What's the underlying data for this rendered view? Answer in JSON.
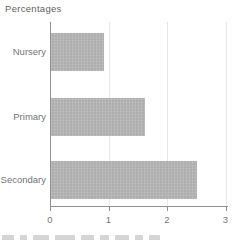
{
  "chart_data": {
    "type": "bar",
    "orientation": "horizontal",
    "title": "Percentages",
    "categories": [
      "Nursery",
      "Primary",
      "Secondary"
    ],
    "values": [
      0.9,
      1.6,
      2.5
    ],
    "xlabel": "",
    "ylabel": "",
    "xlim": [
      0,
      3
    ],
    "xticks": [
      "0",
      "1",
      "2",
      "3"
    ],
    "grid": "vertical-only",
    "legend": "none",
    "colors": {
      "bar": "#b7b7b7",
      "axis": "#909090",
      "gridline": "#e7e7e7",
      "text": "#747474",
      "title": "#5f5f5f",
      "background": "#ffffff"
    }
  }
}
